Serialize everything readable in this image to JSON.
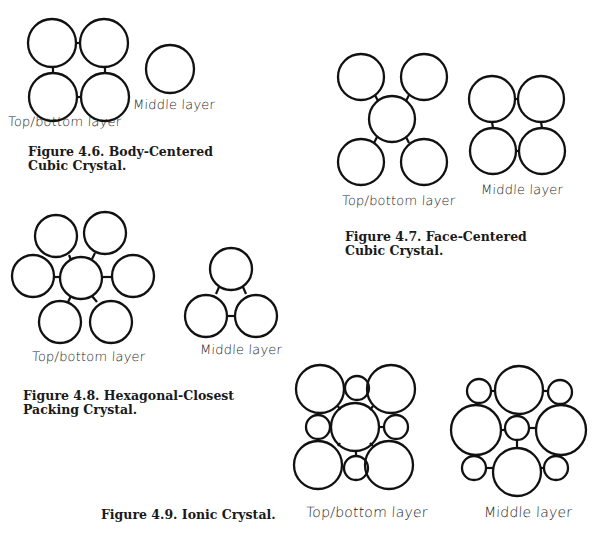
{
  "colors": {
    "stroke": "#111111",
    "background": "#ffffff"
  },
  "figures": [
    {
      "id": "fig46",
      "caption_line1": "Figure 4.6. Body-Centered",
      "caption_line2": "Cubic Crystal.",
      "top_label": "Top/bottom layer",
      "middle_label": "Middle layer",
      "top_circles": [
        [
          52,
          43,
          24
        ],
        [
          104,
          43,
          24
        ],
        [
          53,
          97,
          24
        ],
        [
          105,
          97,
          24
        ]
      ],
      "top_bonds": [
        [
          76,
          43,
          80,
          43
        ],
        [
          53,
          67,
          53,
          73
        ],
        [
          105,
          67,
          105,
          73
        ],
        [
          77,
          97,
          81,
          97
        ]
      ],
      "middle_circles": [
        [
          170,
          69,
          24
        ]
      ],
      "middle_bonds": []
    },
    {
      "id": "fig47",
      "caption_line1": "Figure 4.7. Face-Centered",
      "caption_line2": "Cubic Crystal.",
      "top_label": "Top/bottom layer",
      "middle_label": "Middle layer",
      "top_circles": [
        [
          361,
          77,
          23
        ],
        [
          424,
          77,
          23
        ],
        [
          392,
          119,
          23
        ],
        [
          361,
          162,
          23
        ],
        [
          424,
          162,
          23
        ]
      ],
      "top_bonds": [
        [
          375,
          95,
          378,
          101
        ],
        [
          409,
          95,
          406,
          101
        ],
        [
          377,
          137,
          374,
          143
        ],
        [
          406,
          137,
          409,
          143
        ]
      ],
      "middle_circles": [
        [
          492,
          99,
          23
        ],
        [
          541,
          99,
          23
        ],
        [
          493,
          151,
          23
        ],
        [
          542,
          151,
          23
        ]
      ],
      "middle_bonds": [
        [
          515,
          99,
          518,
          99
        ],
        [
          492,
          122,
          493,
          128
        ],
        [
          541,
          122,
          542,
          128
        ],
        [
          516,
          151,
          519,
          151
        ]
      ]
    },
    {
      "id": "fig48",
      "caption_line1": "Figure 4.8. Hexagonal-Closest",
      "caption_line2": "Packing Crystal.",
      "top_label": "Top/bottom layer",
      "middle_label": "Middle layer",
      "top_circles": [
        [
          81,
          278,
          21
        ],
        [
          56,
          236,
          21
        ],
        [
          105,
          233,
          21
        ],
        [
          33,
          276,
          21
        ],
        [
          133,
          276,
          21
        ],
        [
          60,
          322,
          21
        ],
        [
          111,
          322,
          21
        ]
      ],
      "top_bonds": [
        [
          69,
          255,
          71,
          260
        ],
        [
          95,
          253,
          92,
          259
        ],
        [
          54,
          277,
          60,
          277
        ],
        [
          102,
          277,
          112,
          277
        ],
        [
          71,
          296,
          68,
          302
        ],
        [
          92,
          296,
          97,
          302
        ]
      ],
      "middle_circles": [
        [
          231,
          269,
          21
        ],
        [
          206,
          316,
          21
        ],
        [
          256,
          316,
          21
        ]
      ],
      "middle_bonds": [
        [
          219,
          287,
          216,
          294
        ],
        [
          243,
          287,
          246,
          294
        ],
        [
          227,
          316,
          235,
          316
        ]
      ]
    },
    {
      "id": "fig49",
      "caption_line1": "Figure 4.9. Ionic Crystal.",
      "caption_line2": "",
      "top_label": "Top/bottom layer",
      "middle_label": "Middle layer",
      "top_circles": [
        [
          320,
          389,
          24
        ],
        [
          391,
          389,
          24
        ],
        [
          355,
          427,
          24
        ],
        [
          318,
          465,
          24
        ],
        [
          389,
          465,
          24
        ],
        [
          357,
          388,
          12
        ],
        [
          318,
          427,
          12
        ],
        [
          396,
          427,
          12
        ],
        [
          356,
          468,
          12
        ]
      ],
      "top_bonds": [
        [
          338,
          406,
          340,
          410
        ],
        [
          373,
          406,
          370,
          410
        ],
        [
          330,
          427,
          331,
          427
        ],
        [
          379,
          427,
          384,
          427
        ],
        [
          338,
          446,
          340,
          443
        ],
        [
          373,
          446,
          370,
          443
        ],
        [
          356,
          451,
          356,
          456
        ]
      ],
      "middle_circles": [
        [
          519,
          390,
          24
        ],
        [
          476,
          430,
          25
        ],
        [
          561,
          430,
          25
        ],
        [
          517,
          472,
          24
        ],
        [
          517,
          428,
          12
        ],
        [
          479,
          391,
          12
        ],
        [
          560,
          392,
          12
        ],
        [
          474,
          468,
          12
        ],
        [
          556,
          468,
          12
        ]
      ],
      "middle_bonds": [
        [
          491,
          391,
          495,
          391
        ],
        [
          543,
          391,
          548,
          391
        ],
        [
          518,
          414,
          517,
          416
        ],
        [
          501,
          430,
          505,
          430
        ],
        [
          529,
          428,
          536,
          428
        ],
        [
          517,
          440,
          517,
          448
        ],
        [
          486,
          468,
          493,
          468
        ],
        [
          541,
          468,
          544,
          468
        ],
        [
          476,
          405,
          476,
          403
        ],
        [
          560,
          405,
          560,
          404
        ]
      ]
    }
  ],
  "labels": [
    {
      "figure": 0,
      "kind": "top",
      "x": 8,
      "y": 122
    },
    {
      "figure": 0,
      "kind": "middle",
      "x": 133,
      "y": 98
    },
    {
      "figure": 1,
      "kind": "top",
      "x": 342,
      "y": 192
    },
    {
      "figure": 1,
      "kind": "middle",
      "x": 481,
      "y": 180
    },
    {
      "figure": 2,
      "kind": "top",
      "x": 32,
      "y": 350
    },
    {
      "figure": 2,
      "kind": "middle",
      "x": 200,
      "y": 341
    },
    {
      "figure": 3,
      "kind": "top",
      "x": 306,
      "y": 500
    },
    {
      "figure": 3,
      "kind": "middle",
      "x": 484,
      "y": 500
    }
  ],
  "captions": [
    {
      "figure": 0,
      "x": 28,
      "y": 152
    },
    {
      "figure": 1,
      "x": 345,
      "y": 229
    },
    {
      "figure": 2,
      "x": 23,
      "y": 388
    },
    {
      "figure": 3,
      "x": 101,
      "y": 512
    }
  ]
}
